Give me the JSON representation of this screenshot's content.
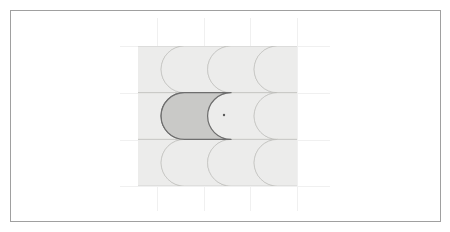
{
  "figure": {
    "background_color": "#ffffff",
    "frame": {
      "name": "figure-border",
      "x": 10,
      "y": 10,
      "width": 430,
      "height": 211,
      "stroke_color": "#a0a0a0",
      "stroke_width": 1,
      "fill": "none"
    },
    "grid": {
      "visible": true,
      "stroke_color": "#f0f0f0",
      "stroke_width": 1,
      "vertical_lines_x": [
        157,
        204,
        250,
        297
      ],
      "horizontal_lines_y": [
        46,
        93,
        140,
        186
      ],
      "vertical_extent": [
        18,
        211
      ],
      "horizontal_extent": [
        120,
        330
      ]
    },
    "tiling": {
      "type": "fish-scale-tiling",
      "rows": 3,
      "columns": 4,
      "origin_x": 138,
      "origin_y": 46,
      "cell_width": 46.5,
      "cell_height": 46.7,
      "bulge_radius": 23.4,
      "clip_left": 138,
      "clip_right": 297,
      "tile_fill": "#ececeb",
      "tile_stroke": "#b9b9b6",
      "tile_stroke_width": 0.6,
      "row_offset_x": 0
    },
    "highlight": {
      "name": "highlighted-tile",
      "row_index": 1,
      "column_index": 1,
      "fill": "#c9c9c7",
      "stroke": "#6e6e6e",
      "stroke_width": 1.2,
      "label": "highlighted prototile"
    },
    "center_point": {
      "name": "tile-center-point",
      "x": 224,
      "y": 115,
      "radius": 1.2,
      "color": "#5a5a5a",
      "label": "center marker"
    }
  }
}
